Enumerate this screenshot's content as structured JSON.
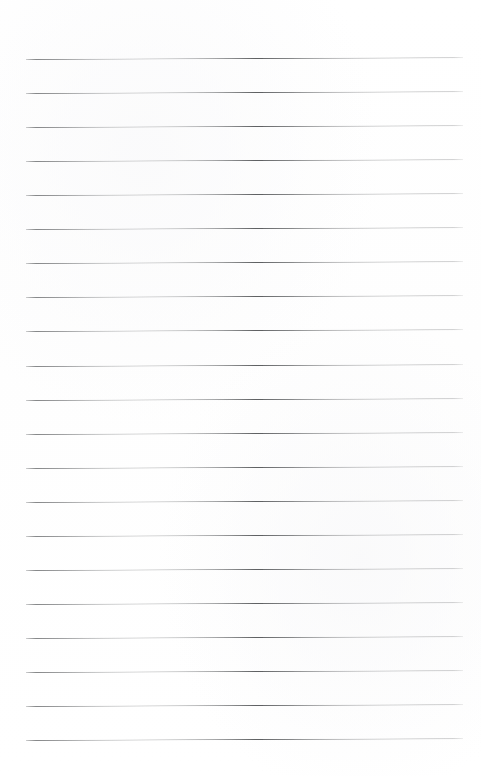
{
  "page": {
    "type": "scanned-lined-paper",
    "width": 481,
    "height": 776,
    "background_color": "#ffffff",
    "content_text": ""
  },
  "rules": {
    "count": 21,
    "color": "#5f6163",
    "thickness_px": 1,
    "first_line_y": 59,
    "spacing_px": 34.05,
    "left_x": 26,
    "right_x": 463,
    "tilt_deg": -0.22,
    "lines": [
      {
        "index": 1,
        "y": 59,
        "left_x": 26,
        "right_x": 463
      },
      {
        "index": 2,
        "y": 93.1,
        "left_x": 26,
        "right_x": 463
      },
      {
        "index": 3,
        "y": 127.1,
        "left_x": 26,
        "right_x": 463
      },
      {
        "index": 4,
        "y": 161.2,
        "left_x": 26,
        "right_x": 463
      },
      {
        "index": 5,
        "y": 195.2,
        "left_x": 26,
        "right_x": 463
      },
      {
        "index": 6,
        "y": 229.3,
        "left_x": 26,
        "right_x": 463
      },
      {
        "index": 7,
        "y": 263.3,
        "left_x": 26,
        "right_x": 463
      },
      {
        "index": 8,
        "y": 297.4,
        "left_x": 26,
        "right_x": 463
      },
      {
        "index": 9,
        "y": 331.4,
        "left_x": 26,
        "right_x": 463
      },
      {
        "index": 10,
        "y": 365.5,
        "left_x": 26,
        "right_x": 463
      },
      {
        "index": 11,
        "y": 399.5,
        "left_x": 26,
        "right_x": 463
      },
      {
        "index": 12,
        "y": 433.6,
        "left_x": 26,
        "right_x": 463
      },
      {
        "index": 13,
        "y": 467.6,
        "left_x": 26,
        "right_x": 463
      },
      {
        "index": 14,
        "y": 501.7,
        "left_x": 26,
        "right_x": 463
      },
      {
        "index": 15,
        "y": 535.7,
        "left_x": 26,
        "right_x": 463
      },
      {
        "index": 16,
        "y": 569.8,
        "left_x": 26,
        "right_x": 463
      },
      {
        "index": 17,
        "y": 603.8,
        "left_x": 26,
        "right_x": 463
      },
      {
        "index": 18,
        "y": 637.9,
        "left_x": 26,
        "right_x": 463
      },
      {
        "index": 19,
        "y": 671.9,
        "left_x": 26,
        "right_x": 463
      },
      {
        "index": 20,
        "y": 706.0,
        "left_x": 26,
        "right_x": 463
      },
      {
        "index": 21,
        "y": 740.0,
        "left_x": 26,
        "right_x": 463
      }
    ]
  },
  "margins": {
    "top_blank_px": 59,
    "bottom_blank_px": 36,
    "left_blank_px": 26,
    "right_blank_px": 18
  }
}
